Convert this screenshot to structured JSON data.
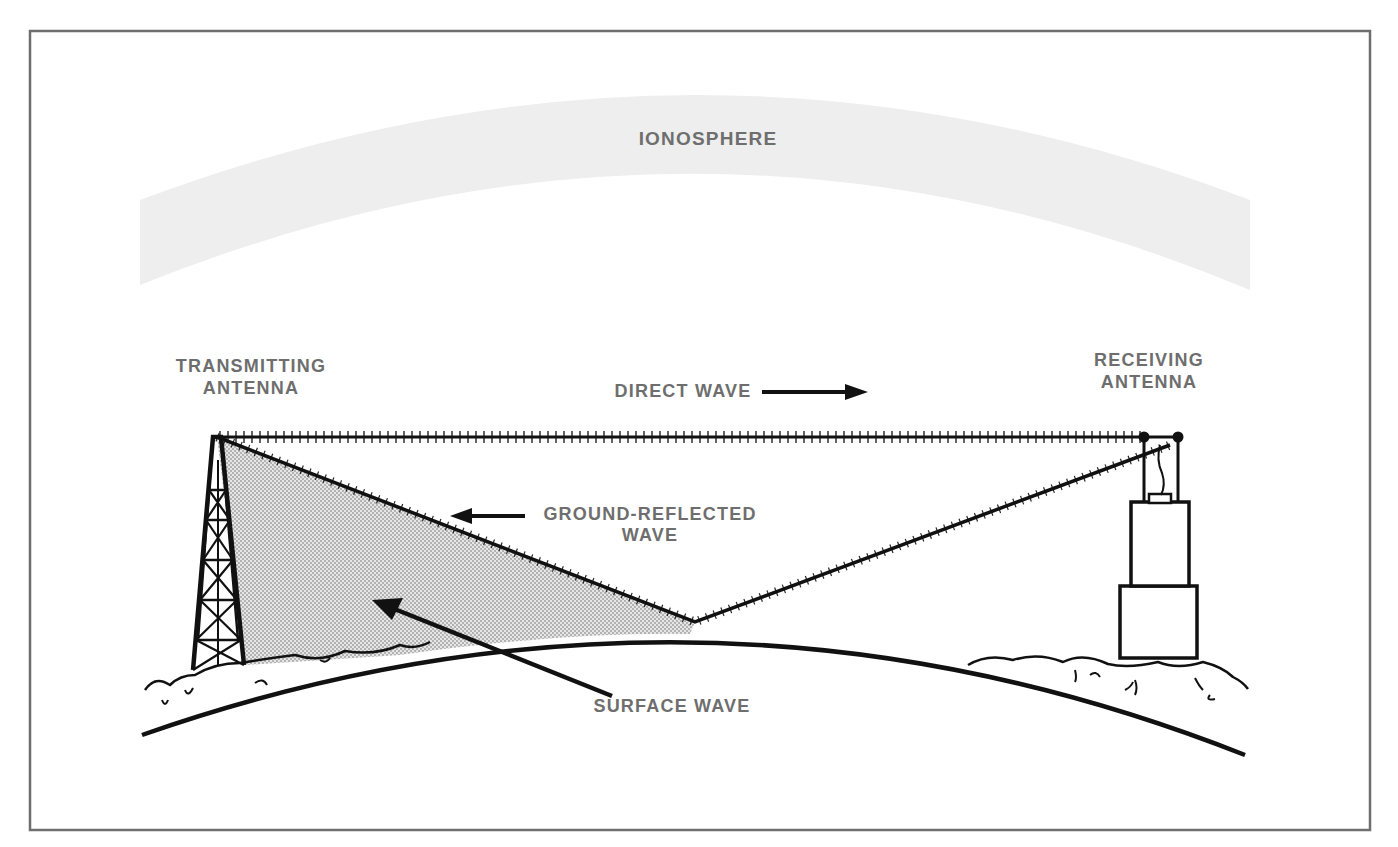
{
  "diagram": {
    "type": "radio wave propagation paths",
    "labels": {
      "ionosphere": "IONOSPHERE",
      "transmitting_line1": "TRANSMITTING",
      "transmitting_line2": "ANTENNA",
      "receiving_line1": "RECEIVING",
      "receiving_line2": "ANTENNA",
      "direct_wave": "DIRECT WAVE",
      "ground_reflected_line1": "GROUND-REFLECTED",
      "ground_reflected_line2": "WAVE",
      "surface_wave": "SURFACE WAVE"
    },
    "colors": {
      "frame": "#6e6e6e",
      "ionosphere_band": "#eeeeee",
      "label_text": "#6e6e6e",
      "line": "#111111",
      "surface_wave_fill": "#d4d4d4"
    }
  }
}
